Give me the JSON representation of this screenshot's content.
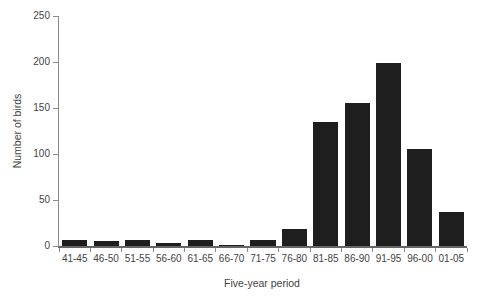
{
  "chart_data": {
    "type": "bar",
    "title": "",
    "xlabel": "Five-year period",
    "ylabel": "Number of birds",
    "categories": [
      "41-45",
      "46-50",
      "51-55",
      "56-60",
      "61-65",
      "66-70",
      "71-75",
      "76-80",
      "81-85",
      "86-90",
      "91-95",
      "96-00",
      "01-05"
    ],
    "values": [
      7,
      5,
      7,
      3,
      6,
      1,
      7,
      18,
      135,
      155,
      199,
      105,
      37
    ],
    "ylim": [
      0,
      250
    ],
    "yticks": [
      0,
      50,
      100,
      150,
      200,
      250
    ],
    "grid": false,
    "legend": null,
    "bar_color": "#1e1e1e",
    "axis_color": "#8a8a8a",
    "text_color": "#444444",
    "background_color": "#ffffff"
  }
}
